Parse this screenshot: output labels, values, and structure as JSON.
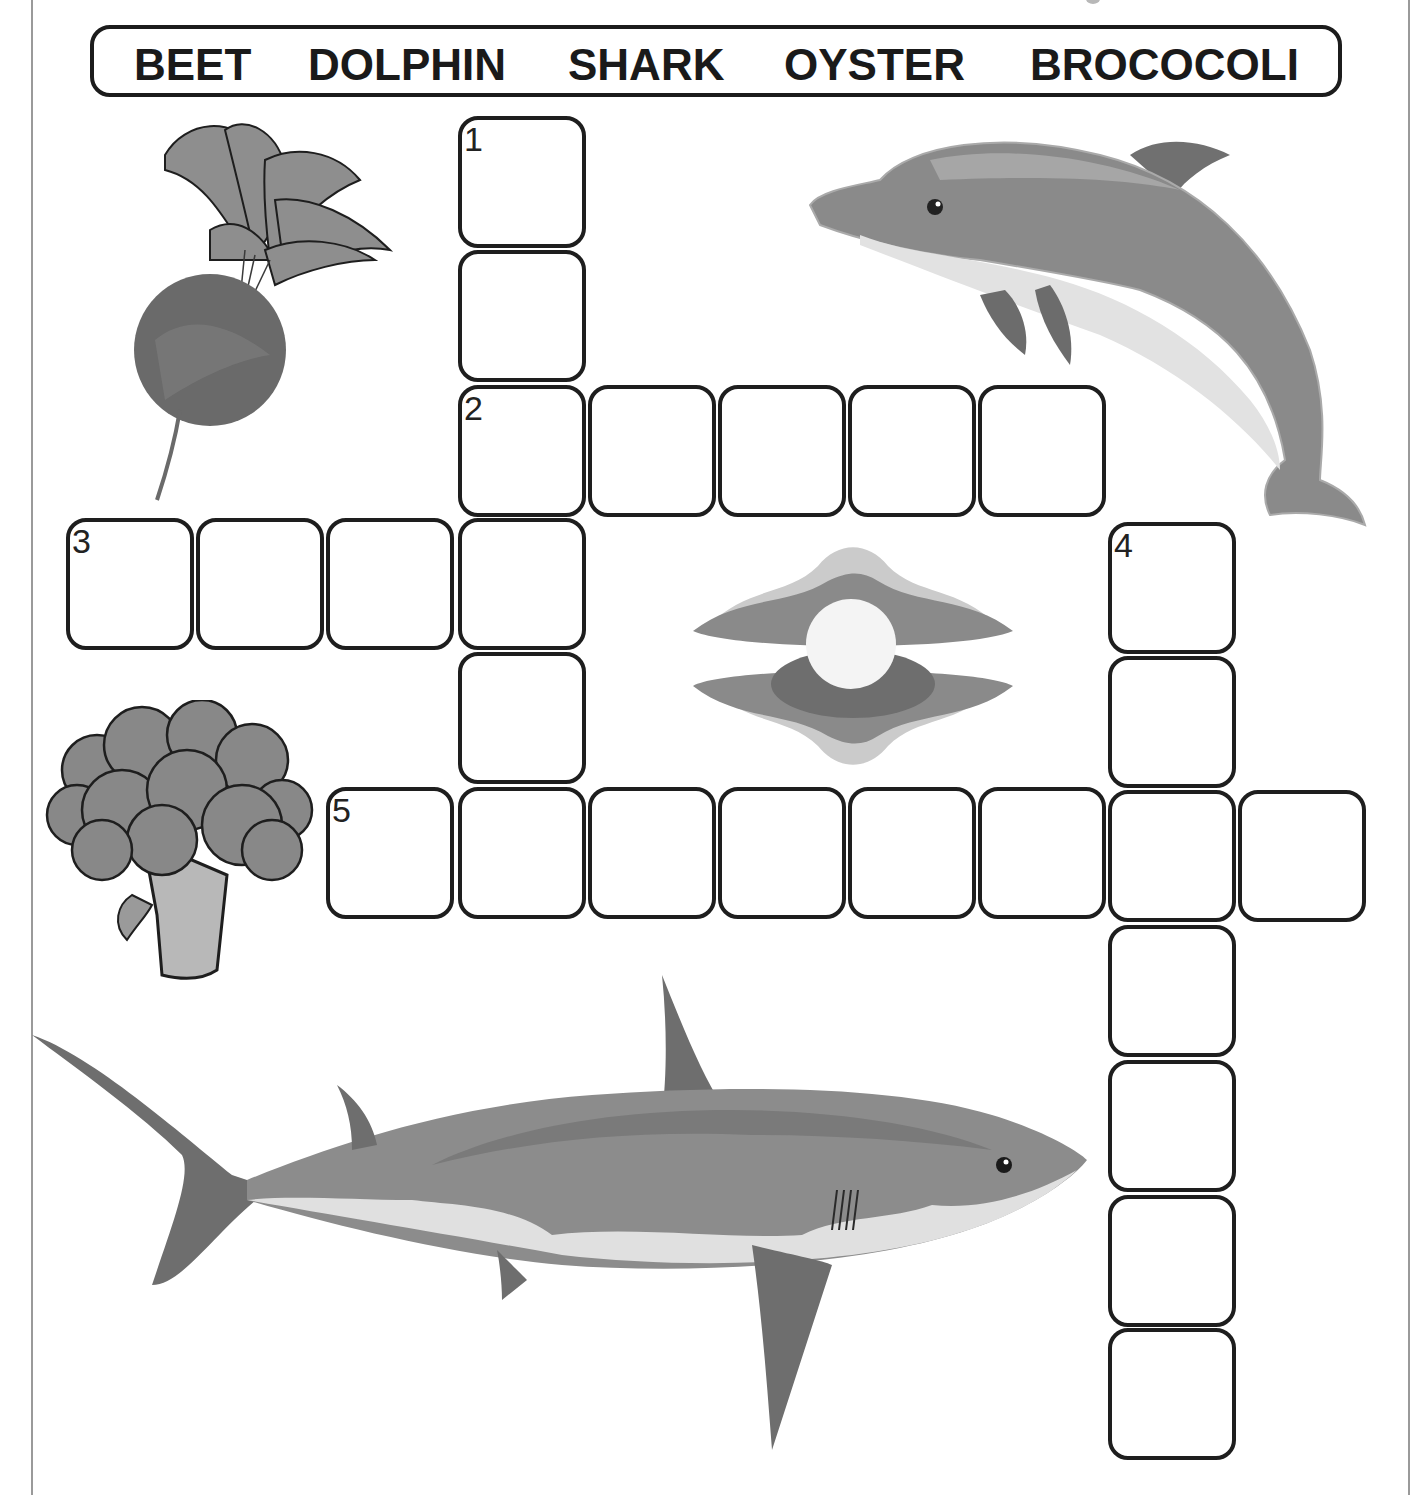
{
  "word_bank": {
    "words": [
      "BEET",
      "DOLPHIN",
      "SHARK",
      "OYSTER",
      "BROCOCOLI"
    ]
  },
  "crossword": {
    "cell_size": {
      "width": 128,
      "height": 132
    },
    "clues": [
      {
        "number": "1",
        "direction": "down",
        "length": 6,
        "picture": "oyster"
      },
      {
        "number": "2",
        "direction": "across",
        "length": 5,
        "picture": "shark"
      },
      {
        "number": "3",
        "direction": "across",
        "length": 4,
        "picture": "beet"
      },
      {
        "number": "4",
        "direction": "down",
        "length": 7,
        "picture": "dolphin"
      },
      {
        "number": "5",
        "direction": "across",
        "length": 8,
        "picture": "broccoli"
      }
    ],
    "cells": [
      {
        "x": 458,
        "y": 116,
        "num": "1"
      },
      {
        "x": 458,
        "y": 250,
        "num": ""
      },
      {
        "x": 458,
        "y": 385,
        "num": "2"
      },
      {
        "x": 588,
        "y": 385,
        "num": ""
      },
      {
        "x": 718,
        "y": 385,
        "num": ""
      },
      {
        "x": 848,
        "y": 385,
        "num": ""
      },
      {
        "x": 978,
        "y": 385,
        "num": ""
      },
      {
        "x": 66,
        "y": 518,
        "num": "3"
      },
      {
        "x": 196,
        "y": 518,
        "num": ""
      },
      {
        "x": 326,
        "y": 518,
        "num": ""
      },
      {
        "x": 458,
        "y": 518,
        "num": ""
      },
      {
        "x": 458,
        "y": 652,
        "num": ""
      },
      {
        "x": 1108,
        "y": 522,
        "num": "4"
      },
      {
        "x": 1108,
        "y": 656,
        "num": ""
      },
      {
        "x": 326,
        "y": 787,
        "num": "5"
      },
      {
        "x": 458,
        "y": 787,
        "num": ""
      },
      {
        "x": 588,
        "y": 787,
        "num": ""
      },
      {
        "x": 718,
        "y": 787,
        "num": ""
      },
      {
        "x": 848,
        "y": 787,
        "num": ""
      },
      {
        "x": 978,
        "y": 787,
        "num": ""
      },
      {
        "x": 1108,
        "y": 790,
        "num": ""
      },
      {
        "x": 1238,
        "y": 790,
        "num": ""
      },
      {
        "x": 1108,
        "y": 925,
        "num": ""
      },
      {
        "x": 1108,
        "y": 1060,
        "num": ""
      },
      {
        "x": 1108,
        "y": 1195,
        "num": ""
      },
      {
        "x": 1108,
        "y": 1328,
        "num": ""
      }
    ]
  },
  "pictures": [
    {
      "name": "beet",
      "label": "beet-illustration"
    },
    {
      "name": "dolphin",
      "label": "dolphin-illustration"
    },
    {
      "name": "oyster",
      "label": "oyster-with-pearl-illustration"
    },
    {
      "name": "broccoli",
      "label": "broccoli-illustration"
    },
    {
      "name": "shark",
      "label": "shark-illustration"
    }
  ],
  "colors": {
    "ink": "#1e1e1e",
    "gray_dark": "#6e6e6e",
    "gray_mid": "#8c8c8c",
    "gray_light": "#c4c4c4",
    "white": "#ffffff"
  }
}
